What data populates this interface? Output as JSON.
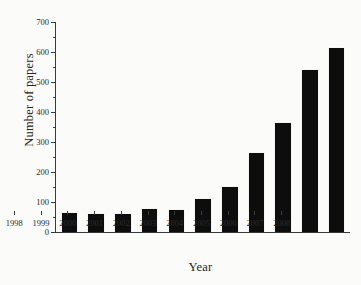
{
  "chart_data": {
    "type": "bar",
    "title": "",
    "xlabel": "Year",
    "ylabel": "Number of papers",
    "categories": [
      "1998",
      "1999",
      "2000",
      "2001",
      "2002",
      "2003",
      "2004",
      "2005",
      "2006",
      "2007",
      "2008"
    ],
    "values": [
      65,
      60,
      60,
      78,
      72,
      110,
      150,
      265,
      365,
      540,
      615
    ],
    "ylim": [
      0,
      700
    ],
    "ytick_labels": [
      "0",
      "100",
      "200",
      "300",
      "400",
      "500",
      "600",
      "700"
    ],
    "ytick_values": [
      0,
      100,
      200,
      300,
      400,
      500,
      600,
      700
    ],
    "yminor_values": [
      50,
      150,
      250,
      350,
      450,
      550,
      650,
      750
    ],
    "grid": false,
    "legend": false,
    "bar_color": "#0d0d0d",
    "axis_color": "#3a3a3a",
    "background": "#fbfbf9"
  }
}
